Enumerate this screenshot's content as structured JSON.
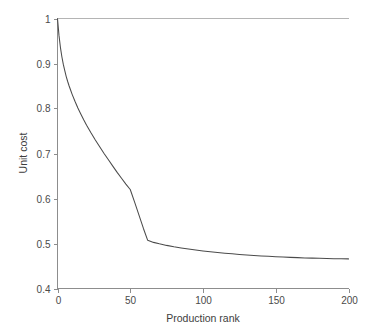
{
  "chart_data": {
    "type": "line",
    "title": "",
    "subtitle": "",
    "xlabel": "Production rank",
    "ylabel": "Unit cost",
    "xlim": [
      0,
      200
    ],
    "ylim": [
      0.4,
      1.0
    ],
    "xticks": [
      0,
      50,
      100,
      150,
      200
    ],
    "yticks": [
      0.4,
      0.5,
      0.6,
      0.7,
      0.8,
      0.9,
      1.0
    ],
    "xtick_labels": [
      "0",
      "50",
      "100",
      "150",
      "200"
    ],
    "ytick_labels": [
      "0.4",
      "0.5",
      "0.6",
      "0.7",
      "0.8",
      "0.9",
      "1"
    ],
    "grid": false,
    "legend": false,
    "legend_position": "none",
    "line_color": "#4b4b4b",
    "background_color": "#ffffff",
    "axis_color": "#8d8d8d",
    "series": [
      {
        "name": "unit cost",
        "x": [
          0,
          1,
          2,
          3,
          4,
          5,
          6,
          7,
          8,
          9,
          10,
          12,
          14,
          16,
          18,
          20,
          23,
          26,
          29,
          32,
          35,
          38,
          41,
          44,
          47,
          50,
          53,
          56,
          59,
          62,
          66,
          70,
          75,
          80,
          85,
          90,
          95,
          100,
          105,
          110,
          115,
          120,
          125,
          130,
          135,
          140,
          145,
          150,
          155,
          160,
          165,
          170,
          175,
          180,
          185,
          190,
          195,
          200
        ],
        "y": [
          1.0,
          0.963,
          0.936,
          0.915,
          0.898,
          0.884,
          0.871,
          0.86,
          0.85,
          0.841,
          0.832,
          0.816,
          0.801,
          0.788,
          0.775,
          0.763,
          0.746,
          0.73,
          0.715,
          0.7,
          0.686,
          0.672,
          0.658,
          0.645,
          0.632,
          0.62,
          0.592,
          0.563,
          0.534,
          0.507,
          0.5025,
          0.4993,
          0.4958,
          0.4927,
          0.49,
          0.4876,
          0.4854,
          0.4834,
          0.4816,
          0.4799,
          0.4784,
          0.477,
          0.4757,
          0.4745,
          0.4734,
          0.4724,
          0.4715,
          0.4707,
          0.4699,
          0.4692,
          0.4686,
          0.468,
          0.4675,
          0.467,
          0.4666,
          0.4663,
          0.466,
          0.4658
        ]
      }
    ],
    "annotations": []
  },
  "figure": {
    "y_axis_title": "Unit cost",
    "x_axis_title": "Production rank"
  }
}
